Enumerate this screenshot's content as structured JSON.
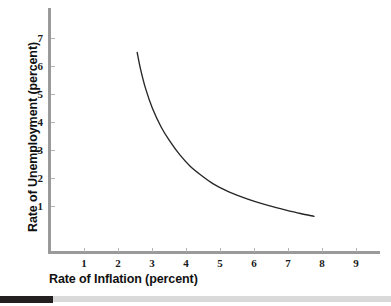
{
  "chart_data": {
    "type": "line",
    "title": "",
    "subtitle": "",
    "xlabel": "Rate of Inflation (percent)",
    "ylabel": "Rate of Unemployment (percent)",
    "xlim": [
      0,
      9.7
    ],
    "ylim": [
      0,
      7.8
    ],
    "xticks": [
      "1",
      "2",
      "3",
      "4",
      "5",
      "6",
      "7",
      "8",
      "9"
    ],
    "yticks": [
      "1",
      "2",
      "3",
      "4",
      "5",
      "6",
      "7"
    ],
    "grid": false,
    "legend": null,
    "annotations": [],
    "series": [
      {
        "name": "Phillips curve",
        "color": "#262626",
        "x": [
          2.55,
          2.65,
          2.8,
          3.0,
          3.25,
          3.5,
          3.8,
          4.1,
          4.45,
          4.8,
          5.2,
          5.6,
          6.0,
          6.45,
          6.9,
          7.35,
          7.75
        ],
        "y": [
          6.5,
          5.9,
          5.2,
          4.5,
          3.85,
          3.35,
          2.85,
          2.45,
          2.1,
          1.8,
          1.55,
          1.35,
          1.18,
          1.02,
          0.88,
          0.75,
          0.65
        ]
      }
    ]
  },
  "axes": {
    "y_tick_labels": [
      "7",
      "6",
      "5",
      "4",
      "3",
      "2",
      "1"
    ],
    "x_tick_labels": [
      "1",
      "2",
      "3",
      "4",
      "5",
      "6",
      "7",
      "8",
      "9"
    ],
    "x_title": "Rate of Inflation (percent)",
    "y_title": "Rate of Unemployment (percent)",
    "axis_color": "#9a9a9a",
    "curve_color": "#262626"
  },
  "footer": {
    "dark_color": "#231f20",
    "light_color": "#d9d9d9"
  }
}
